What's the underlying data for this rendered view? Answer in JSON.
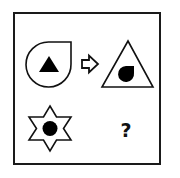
{
  "puzzle": {
    "type": "analogy",
    "frame_color": "#1a1a1a",
    "stroke_color": "#111111",
    "fill_color": "#000000",
    "background_color": "#ffffff",
    "row1": {
      "source": {
        "outer_shape": "teardrop-icon",
        "outer_fill": "outline",
        "inner_shape": "triangle-icon",
        "inner_fill": "solid"
      },
      "operator": "arrow-right-icon",
      "target": {
        "outer_shape": "triangle-icon",
        "outer_fill": "outline",
        "inner_shape": "teardrop-icon",
        "inner_fill": "solid"
      }
    },
    "row2": {
      "source": {
        "outer_shape": "hexagram-star-icon",
        "outer_fill": "outline",
        "inner_shape": "circle-icon",
        "inner_fill": "solid"
      },
      "answer_placeholder": "?"
    }
  }
}
